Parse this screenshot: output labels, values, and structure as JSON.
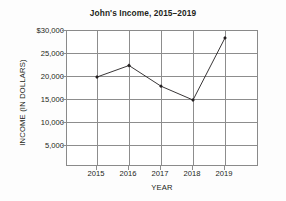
{
  "chart_data": {
    "type": "line",
    "title": "John's Income, 2015–2019",
    "xlabel": "YEAR",
    "ylabel": "INCOME (IN DOLLARS)",
    "categories": [
      "2015",
      "2016",
      "2017",
      "2018",
      "2019"
    ],
    "values": [
      20000,
      22500,
      18000,
      15000,
      28500
    ],
    "series": [
      {
        "name": "John's Income",
        "values": [
          20000,
          22500,
          18000,
          15000,
          28500
        ]
      }
    ],
    "ylim": [
      0,
      30000
    ],
    "ytick_values": [
      30000,
      25000,
      20000,
      15000,
      10000,
      5000
    ],
    "ytick_labels": [
      "$30,000",
      "25,000",
      "20,000",
      "15,000",
      "10,000",
      "5,000"
    ],
    "xtick_labels": [
      "2015",
      "2016",
      "2017",
      "2018",
      "2019"
    ],
    "grid": true,
    "legend": false,
    "legend_position": "none",
    "marker": "diamond",
    "line_color": "#231f20",
    "grid_color": "#8d8d8d",
    "plot_background": "#ffffff",
    "figure_background": "#fdfdfd"
  }
}
